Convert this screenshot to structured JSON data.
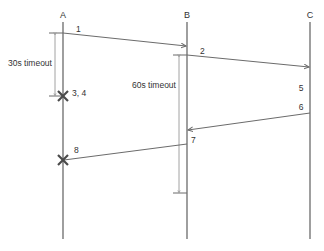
{
  "diagram": {
    "type": "sequence",
    "lifelines": [
      {
        "id": "A",
        "label": "A",
        "x": 63
      },
      {
        "id": "B",
        "label": "B",
        "x": 187
      },
      {
        "id": "C",
        "label": "C",
        "x": 310
      }
    ],
    "messages": [
      {
        "label": "1",
        "from": "A",
        "to": "B"
      },
      {
        "label": "2",
        "from": "B",
        "to": "C"
      },
      {
        "label": "6",
        "from": "C",
        "to": "B"
      },
      {
        "label": "8",
        "from": "B",
        "to": "A",
        "ends_in_failure": true
      }
    ],
    "annotations": {
      "a_timeout": "30s timeout",
      "b_timeout": "60s timeout",
      "fail_a": "3, 4",
      "step5": "5",
      "step7": "7"
    },
    "colors": {
      "line": "#6b6b6b",
      "bracket": "#8a8a8a",
      "cross": "#4a4a4a",
      "text": "#333333"
    }
  }
}
